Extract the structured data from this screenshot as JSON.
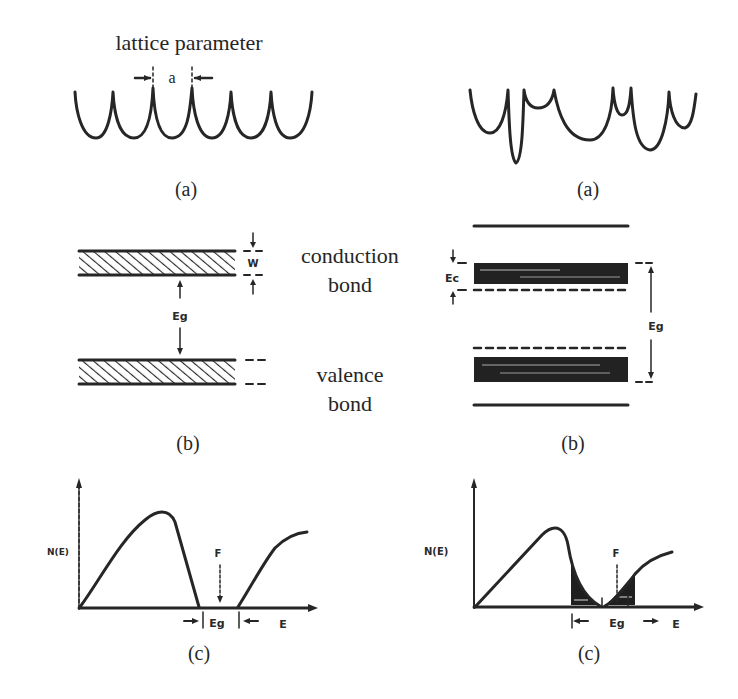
{
  "figure": {
    "left_column": {
      "panel_a": {
        "title": "lattice parameter",
        "spacing_label": "a",
        "caption": "(a)"
      },
      "panel_b": {
        "band_width_label": "W",
        "gap_label": "Eg",
        "conduction_label_line1": "conduction",
        "conduction_label_line2": "bond",
        "valence_label_line1": "valence",
        "valence_label_line2": "bond",
        "caption": "(b)"
      },
      "panel_c": {
        "y_axis_label": "N(E)",
        "fermi_label": "F",
        "gap_label": "Eg",
        "x_axis_label": "E",
        "caption": "(c)"
      }
    },
    "right_column": {
      "panel_a": {
        "caption": "(a)"
      },
      "panel_b": {
        "tail_label": "Ec",
        "gap_label": "Eg",
        "caption": "(b)"
      },
      "panel_c": {
        "y_axis_label": "N(E)",
        "fermi_label": "F",
        "gap_label": "Eg",
        "x_axis_label": "E",
        "caption": "(c)"
      }
    },
    "colors": {
      "ink": "#262626",
      "background": "#ffffff"
    }
  }
}
